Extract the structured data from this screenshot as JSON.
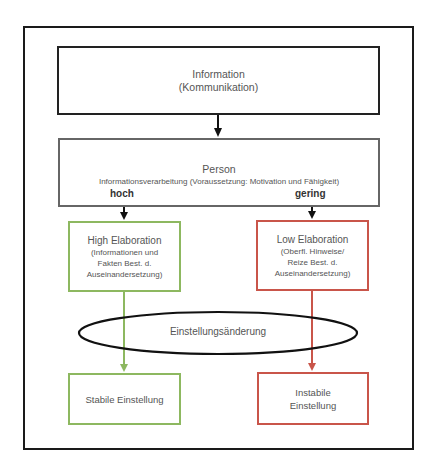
{
  "diagram": {
    "type": "flowchart",
    "nodes": {
      "information": {
        "title": "Information",
        "subtitle": "(Kommunikation)"
      },
      "person": {
        "title": "Person",
        "subtitle": "Informationsverarbeitung (Voraussetzung: Motivation und Fähigkeit)",
        "level_high": "hoch",
        "level_low": "gering"
      },
      "high_elaboration": {
        "title": "High Elaboration",
        "desc_line1": "(Informationen und",
        "desc_line2": "Fakten Best. d.",
        "desc_line3": "Auseinandersetzung)",
        "border_color": "#8db860"
      },
      "low_elaboration": {
        "title": "Low Elaboration",
        "desc_line1": "(Oberfl. Hinweise/",
        "desc_line2": "Reize Best. d.",
        "desc_line3": "Auseinandersetzung)",
        "border_color": "#c9554a"
      },
      "attitude_change": {
        "label": "Einstellungsänderung"
      },
      "stable": {
        "label": "Stabile Einstellung",
        "border_color": "#8db860"
      },
      "unstable": {
        "line1": "Instabile",
        "line2": "Einstellung",
        "border_color": "#c9554a"
      }
    },
    "edges": [
      {
        "from": "information",
        "to": "person",
        "color": "#111111"
      },
      {
        "from": "person",
        "to": "high_elaboration",
        "label": "hoch",
        "color": "#111111"
      },
      {
        "from": "person",
        "to": "low_elaboration",
        "label": "gering",
        "color": "#111111"
      },
      {
        "from": "high_elaboration",
        "to": "stable",
        "color": "#8db860"
      },
      {
        "from": "low_elaboration",
        "to": "unstable",
        "color": "#c9554a"
      }
    ]
  }
}
